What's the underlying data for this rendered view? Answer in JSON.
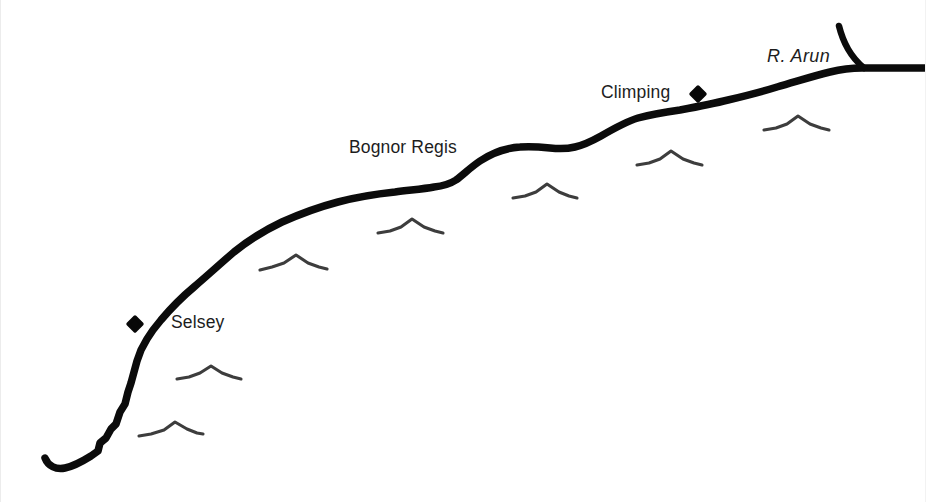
{
  "map": {
    "title": "Coastline of West Sussex between Selsey and the River Arun",
    "type": "sketch-map",
    "background_color": "#ffffff",
    "coastline_color": "#0b0b0b",
    "marker_color": "#080808",
    "chevron_color": "#3d3d3d",
    "label_color": "#1d1d1d",
    "labels": [
      {
        "id": "selsey",
        "text": "Selsey",
        "style": "regular",
        "x": 170,
        "y": 314
      },
      {
        "id": "bognor",
        "text": "Bognor Regis",
        "style": "regular",
        "x": 348,
        "y": 139
      },
      {
        "id": "climping",
        "text": "Climping",
        "style": "regular",
        "x": 600,
        "y": 84
      },
      {
        "id": "arun",
        "text": "R. Arun",
        "style": "italic",
        "x": 766,
        "y": 47
      }
    ],
    "settlements": [
      {
        "id": "selsey",
        "label": "Selsey",
        "x": 134,
        "y": 324
      },
      {
        "id": "climping",
        "label": "Climping",
        "x": 697,
        "y": 94
      }
    ],
    "features": [
      {
        "id": "coastline",
        "name": "coastline"
      },
      {
        "id": "river-arun",
        "name": "River Arun"
      }
    ],
    "chevrons": [
      {
        "id": "chevron-1",
        "x": 170,
        "y": 432
      },
      {
        "id": "chevron-2",
        "x": 207,
        "y": 374
      },
      {
        "id": "chevron-3",
        "x": 292,
        "y": 262
      },
      {
        "id": "chevron-4",
        "x": 409,
        "y": 226
      },
      {
        "id": "chevron-5",
        "x": 541,
        "y": 190
      },
      {
        "id": "chevron-6",
        "x": 668,
        "y": 157
      },
      {
        "id": "chevron-7",
        "x": 795,
        "y": 122
      }
    ]
  }
}
